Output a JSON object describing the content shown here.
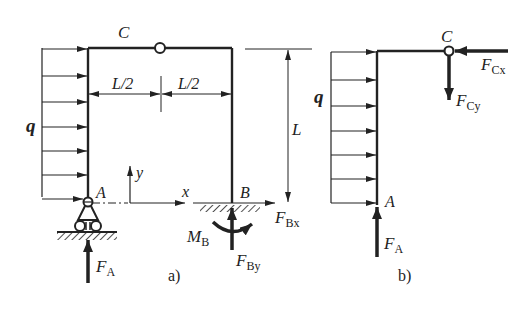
{
  "figure_a": {
    "caption": "a)",
    "labels": {
      "hinge": "C",
      "support_a": "A",
      "support_b": "B",
      "load": "q",
      "half_span_left": "L/2",
      "half_span_right": "L/2",
      "height": "L",
      "axis_x": "x",
      "axis_y": "y",
      "force_a_main": "F",
      "force_a_sub": "A",
      "moment_b_main": "M",
      "moment_b_sub": "B",
      "force_bx_main": "F",
      "force_bx_sub": "Bx",
      "force_by_main": "F",
      "force_by_sub": "By"
    }
  },
  "figure_b": {
    "caption": "b)",
    "labels": {
      "hinge": "C",
      "support_a": "A",
      "load": "q",
      "force_a_main": "F",
      "force_a_sub": "A",
      "force_cx_main": "F",
      "force_cx_sub": "Cx",
      "force_cy_main": "F",
      "force_cy_sub": "Cy"
    }
  },
  "colors": {
    "ink": "#222222",
    "background": "#ffffff"
  }
}
